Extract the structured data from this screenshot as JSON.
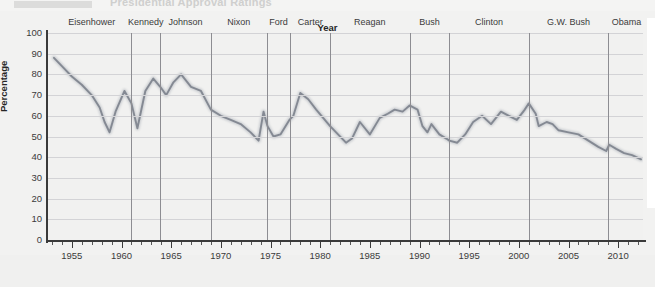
{
  "figure": {
    "partial_title": "Presidential Approval Ratings",
    "background_color": "#f1f1f0",
    "line_color": "#8a8f99",
    "grid_color": "#d3d3d6",
    "divider_color": "#8d8d92"
  },
  "chart_data": {
    "type": "line",
    "title": "Presidential Approval Ratings",
    "xlabel": "Year",
    "ylabel": "Percentage",
    "xlim": [
      1952.5,
      2012.5
    ],
    "ylim": [
      0,
      100
    ],
    "grid": true,
    "legend": "none",
    "yticks": [
      0,
      10,
      20,
      30,
      40,
      50,
      60,
      70,
      80,
      90,
      100
    ],
    "xticks_major": [
      1955,
      1960,
      1965,
      1970,
      1975,
      1980,
      1985,
      1990,
      1995,
      2000,
      2005,
      2010
    ],
    "xtick_minor_step": 1,
    "annotations": {
      "type": "president-terms",
      "terms": [
        {
          "label": "Eisenhower",
          "start": 1953.0,
          "end": 1961.0
        },
        {
          "label": "Kennedy",
          "start": 1961.0,
          "end": 1963.9
        },
        {
          "label": "Johnson",
          "start": 1963.9,
          "end": 1969.0
        },
        {
          "label": "Nixon",
          "start": 1969.0,
          "end": 1974.6
        },
        {
          "label": "Ford",
          "start": 1974.6,
          "end": 1977.0
        },
        {
          "label": "Carter",
          "start": 1977.0,
          "end": 1981.0
        },
        {
          "label": "Reagan",
          "start": 1981.0,
          "end": 1989.0
        },
        {
          "label": "Bush",
          "start": 1989.0,
          "end": 1993.0
        },
        {
          "label": "Clinton",
          "start": 1993.0,
          "end": 2001.0
        },
        {
          "label": "G.W. Bush",
          "start": 2001.0,
          "end": 2009.0
        },
        {
          "label": "Obama",
          "start": 2009.0,
          "end": 2012.7
        }
      ]
    },
    "series": [
      {
        "name": "Approval",
        "x": [
          1953.2,
          1954.0,
          1955.0,
          1956.0,
          1957.0,
          1957.8,
          1958.3,
          1958.8,
          1959.4,
          1960.3,
          1961.0,
          1961.6,
          1962.4,
          1963.2,
          1963.9,
          1964.5,
          1965.2,
          1966.0,
          1967.0,
          1968.0,
          1969.0,
          1970.0,
          1971.0,
          1972.0,
          1973.0,
          1973.8,
          1974.3,
          1974.7,
          1975.3,
          1976.0,
          1976.9,
          1977.3,
          1978.0,
          1978.8,
          1979.6,
          1980.3,
          1981.0,
          1981.8,
          1982.6,
          1983.2,
          1984.0,
          1985.0,
          1986.0,
          1986.8,
          1987.5,
          1988.3,
          1989.0,
          1989.8,
          1990.3,
          1990.8,
          1991.2,
          1992.0,
          1992.7,
          1993.0,
          1993.8,
          1994.6,
          1995.4,
          1996.3,
          1997.2,
          1998.2,
          1999.0,
          1999.8,
          2000.6,
          2001.0,
          2001.7,
          2002.0,
          2002.8,
          2003.4,
          2004.0,
          2005.0,
          2006.0,
          2007.0,
          2008.0,
          2008.8,
          2009.1,
          2009.8,
          2010.6,
          2011.4,
          2012.3
        ],
        "y": [
          88,
          84,
          79,
          75,
          70,
          64,
          57,
          52,
          62,
          72,
          66,
          54,
          72,
          78,
          74,
          70,
          76,
          80,
          74,
          72,
          63,
          60,
          58,
          56,
          52,
          48,
          62,
          55,
          50,
          51,
          58,
          60,
          71,
          68,
          63,
          59,
          55,
          51,
          47,
          49,
          57,
          51,
          59,
          61,
          63,
          62,
          65,
          63,
          55,
          52,
          56,
          51,
          49,
          48,
          47,
          51,
          57,
          60,
          56,
          62,
          60,
          58,
          63,
          66,
          61,
          55,
          57,
          56,
          53,
          52,
          51,
          48,
          45,
          43,
          46,
          44,
          42,
          41,
          39
        ],
        "comment": "Smoothed approval percentage, 1953-2012"
      }
    ]
  }
}
